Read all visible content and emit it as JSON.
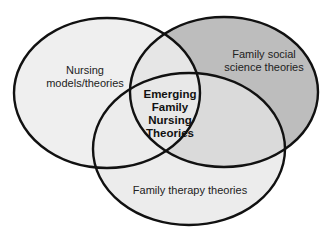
{
  "diagram": {
    "type": "venn",
    "sets": [
      {
        "id": "nursing",
        "label": "Nursing models/theories",
        "lines": [
          "Nursing",
          "models/theories"
        ],
        "fill": "#efefef"
      },
      {
        "id": "social",
        "label": "Family social science theories",
        "lines": [
          "Family social",
          "science theories"
        ],
        "fill": "#bdbdbd"
      },
      {
        "id": "therapy",
        "label": "Family therapy theories",
        "lines": [
          "Family therapy theories"
        ],
        "fill": "#ececec"
      }
    ],
    "intersection": {
      "label": "Emerging Family Nursing Theories",
      "lines": [
        "Emerging",
        "Family",
        "Nursing",
        "Theories"
      ]
    },
    "colors": {
      "outline": "#111111",
      "nursing_fill": "#efefef",
      "social_fill": "#bdbdbd",
      "therapy_fill": "#ececec",
      "overlap_fill": "#e4e4e4"
    }
  }
}
